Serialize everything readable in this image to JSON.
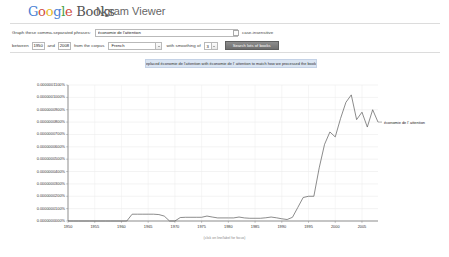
{
  "header": {
    "logo_google": "Google",
    "logo_books": "Books",
    "product_title": "Ngram Viewer"
  },
  "form": {
    "phrases_label": "Graph these comma-separated phrases:",
    "phrases_value": "économie de l'attention",
    "phrases_placeholder": "",
    "dropdown_icon": "chevron-down-icon",
    "case_insensitive_label": "case-insensitive",
    "case_insensitive_checked": false,
    "between_label": "between",
    "start_year": "1950",
    "and_label": "and",
    "end_year": "2008",
    "corpus_label": "from the corpus",
    "corpus_value": "French",
    "corpus_options": [
      "English",
      "French",
      "German",
      "Spanish",
      "Russian",
      "Hebrew",
      "Chinese"
    ],
    "smoothing_label": "with smoothing of",
    "smoothing_value": "3",
    "smoothing_options": [
      "0",
      "1",
      "2",
      "3",
      "4",
      "5",
      "10",
      "20",
      "50"
    ],
    "search_button": "Search lots of books"
  },
  "notice": {
    "text": "Replaced économie de l'attention with économie de l' attention to match how we processed the books."
  },
  "chart_data": {
    "type": "line",
    "title": "",
    "xlabel": "",
    "ylabel": "",
    "caption": "(click on line/label for focus)",
    "grid": true,
    "legend_position": "right-inline",
    "xlim": [
      1950,
      2008
    ],
    "ylim": [
      0.0,
      1.1e-07
    ],
    "xticks": [
      "1950",
      "1955",
      "1960",
      "1965",
      "1970",
      "1975",
      "1980",
      "1985",
      "1990",
      "1995",
      "2000",
      "2005"
    ],
    "yticks": [
      "0.0000000000%",
      "0.0000000100%",
      "0.0000000200%",
      "0.0000000300%",
      "0.0000000400%",
      "0.0000000500%",
      "0.0000000600%",
      "0.0000000700%",
      "0.0000000800%",
      "0.0000000900%",
      "0.0000001000%",
      "0.0000001100%"
    ],
    "series": [
      {
        "name": "économie de l' attention",
        "color": "#5a5a5a",
        "x": [
          1950,
          1951,
          1952,
          1953,
          1954,
          1955,
          1956,
          1957,
          1958,
          1959,
          1960,
          1961,
          1962,
          1963,
          1964,
          1965,
          1966,
          1967,
          1968,
          1969,
          1970,
          1971,
          1972,
          1973,
          1974,
          1975,
          1976,
          1977,
          1978,
          1979,
          1980,
          1981,
          1982,
          1983,
          1984,
          1985,
          1986,
          1987,
          1988,
          1989,
          1990,
          1991,
          1992,
          1993,
          1994,
          1995,
          1996,
          1997,
          1998,
          1999,
          2000,
          2001,
          2002,
          2003,
          2004,
          2005,
          2006,
          2007,
          2008
        ],
        "values": [
          0,
          0,
          0,
          0,
          0,
          0,
          0,
          0,
          0,
          0,
          0,
          0,
          5.5e-09,
          5.5e-09,
          5.5e-09,
          5.5e-09,
          5.5e-09,
          5.2e-09,
          4e-09,
          0,
          0,
          2.8e-09,
          3e-09,
          3e-09,
          3e-09,
          3e-09,
          4e-09,
          3.2e-09,
          2.5e-09,
          2.5e-09,
          2.5e-09,
          2.5e-09,
          3.2e-09,
          2.5e-09,
          2.2e-09,
          2.2e-09,
          2.2e-09,
          2.6e-09,
          3.2e-09,
          2.6e-09,
          1.8e-09,
          1.2e-09,
          3e-09,
          1.1e-08,
          1.9e-08,
          2e-08,
          2e-08,
          4.3e-08,
          6.2e-08,
          7.2e-08,
          6.8e-08,
          8.3e-08,
          9.6e-08,
          1.02e-07,
          8.2e-08,
          8.8e-08,
          7.6e-08,
          9e-08,
          8e-08
        ]
      }
    ]
  }
}
